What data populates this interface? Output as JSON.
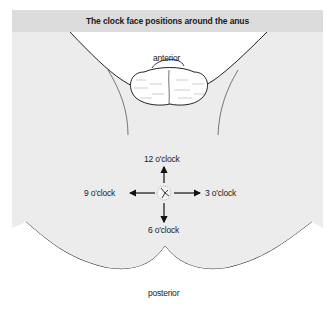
{
  "figure": {
    "title": "The clock face positions around the anus",
    "labels": {
      "anterior": "anterior",
      "posterior": "posterior",
      "twelve": "12 o'clock",
      "three": "3 o'clock",
      "six": "6 o'clock",
      "nine": "9  o'clock"
    },
    "colors": {
      "background": "#ececec",
      "title_bar": "#dcdcdc",
      "skin_region": "#ffffff",
      "lines": "#222222"
    }
  }
}
